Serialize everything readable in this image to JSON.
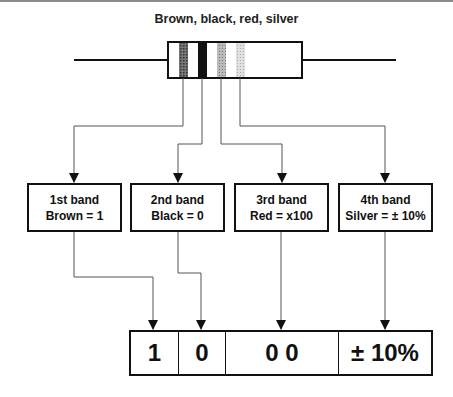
{
  "title": "Brown, black, red, silver",
  "resistor": {
    "bands": [
      {
        "color_name": "brown",
        "fill": "#555555"
      },
      {
        "color_name": "black",
        "fill": "#111111"
      },
      {
        "color_name": "red",
        "fill": "#9a9a9a"
      },
      {
        "color_name": "silver",
        "fill": "#cfcfcf"
      }
    ]
  },
  "band_boxes": [
    {
      "heading": "1st band",
      "value": "Brown = 1"
    },
    {
      "heading": "2nd band",
      "value": "Black = 0"
    },
    {
      "heading": "3rd band",
      "value": "Red = x100"
    },
    {
      "heading": "4th band",
      "value": "Silver = ± 10%"
    }
  ],
  "result": {
    "cells": [
      "1",
      "0",
      "0 0",
      "± 10%"
    ]
  }
}
